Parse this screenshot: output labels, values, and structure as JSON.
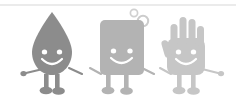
{
  "image": {
    "title": "Hygiene mascots holding hands",
    "width": 236,
    "height": 102,
    "background_color": "#ffffff",
    "style": "grayscale flat cartoon illustration"
  },
  "divider": {
    "name": "top-horizontal-rule",
    "color": "#d8d8d8",
    "y": 5,
    "thickness": 1
  },
  "palette": {
    "droplet_body": "#8c8c8c",
    "soap_body": "#b3b3b3",
    "hand_body": "#c6c6c6",
    "face_feature": "#ffffff",
    "bubble_stroke": "#d0d0d0",
    "background": "#ffffff"
  },
  "characters": [
    {
      "name": "water-droplet-character",
      "label": "Water droplet",
      "body_color": "#8c8c8c",
      "expression": "smiling",
      "eyes": 2,
      "arms": 2,
      "legs": 2,
      "position": "left"
    },
    {
      "name": "soap-bar-character",
      "label": "Soap bar",
      "body_color": "#b3b3b3",
      "expression": "smiling",
      "eyes": 2,
      "arms": 2,
      "legs": 2,
      "position": "center"
    },
    {
      "name": "hand-character",
      "label": "Hand",
      "body_color": "#c6c6c6",
      "expression": "smiling",
      "eyes": 2,
      "arms": 2,
      "legs": 2,
      "fingers": 5,
      "position": "right"
    }
  ],
  "bubbles": [
    {
      "name": "bubble-small",
      "cx": 134,
      "cy": 13,
      "r": 3.6,
      "stroke": "#d0d0d0"
    },
    {
      "name": "bubble-large",
      "cx": 143,
      "cy": 21,
      "r": 5.2,
      "stroke": "#cccccc"
    }
  ]
}
